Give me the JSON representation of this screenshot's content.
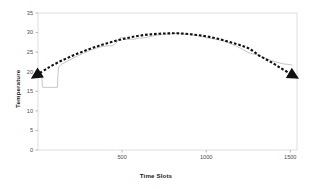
{
  "chart_data": {
    "type": "line",
    "title": "",
    "xlabel": "Time Slots",
    "ylabel": "Temperature",
    "xlim": [
      0,
      1540
    ],
    "ylim": [
      0,
      35
    ],
    "xticks": [
      500,
      1000,
      1500
    ],
    "xtick_labels": [
      "500",
      "1000",
      "1500"
    ],
    "yticks": [
      0,
      5,
      10,
      15,
      20,
      25,
      30,
      35
    ],
    "ytick_labels": [
      "0",
      "5",
      "10",
      "15",
      "20",
      "25",
      "30",
      "35"
    ],
    "grid": false,
    "legend": "none",
    "series": [
      {
        "name": "measured-temperature",
        "style": "solid-thin-gray",
        "color": "#b3b3b3",
        "x": [
          10,
          18,
          22,
          24,
          26,
          30,
          40,
          55,
          70,
          85,
          100,
          115,
          118,
          122,
          140,
          170,
          200,
          235,
          270,
          300,
          330,
          360,
          390,
          415,
          440,
          455,
          470,
          480,
          495,
          510,
          520,
          535,
          550,
          570,
          590,
          610,
          635,
          660,
          690,
          715,
          740,
          765,
          790,
          815,
          840,
          860,
          880,
          900,
          920,
          945,
          965,
          985,
          1005,
          1030,
          1055,
          1080,
          1105,
          1130,
          1155,
          1180,
          1205,
          1230,
          1255,
          1275,
          1295,
          1315,
          1340,
          1360,
          1380,
          1400,
          1420,
          1440,
          1460,
          1480,
          1500,
          1510
        ],
        "y": [
          19.8,
          19.8,
          19.7,
          18.0,
          16.1,
          16.0,
          16.0,
          16.0,
          16.0,
          16.0,
          16.0,
          16.0,
          18.6,
          21.2,
          21.9,
          22.6,
          23.3,
          24.0,
          24.7,
          25.3,
          25.8,
          26.2,
          26.5,
          26.6,
          26.6,
          27.0,
          27.6,
          28.3,
          28.8,
          28.6,
          28.3,
          28.2,
          28.3,
          28.3,
          28.5,
          28.6,
          28.7,
          28.9,
          29.2,
          29.4,
          29.5,
          29.6,
          29.7,
          29.8,
          29.8,
          29.7,
          29.5,
          29.6,
          29.4,
          29.3,
          29.0,
          28.9,
          28.6,
          28.5,
          28.3,
          28.1,
          27.8,
          27.4,
          27.0,
          26.5,
          26.0,
          25.4,
          24.8,
          24.6,
          24.4,
          24.1,
          23.6,
          23.3,
          23.0,
          22.7,
          22.4,
          22.2,
          22.0,
          21.9,
          21.8,
          21.7
        ]
      },
      {
        "name": "fitted-trend",
        "style": "dashed-thick-black",
        "color": "#111111",
        "arrow_start": true,
        "arrow_end": true,
        "x": [
          12,
          60,
          120,
          180,
          240,
          300,
          360,
          420,
          480,
          540,
          600,
          660,
          720,
          780,
          840,
          900,
          960,
          1020,
          1080,
          1140,
          1200,
          1260,
          1320,
          1380,
          1440,
          1500
        ],
        "y": [
          19.7,
          21.0,
          22.4,
          23.6,
          24.7,
          25.7,
          26.6,
          27.4,
          28.1,
          28.7,
          29.2,
          29.5,
          29.7,
          29.8,
          29.8,
          29.6,
          29.3,
          28.9,
          28.3,
          27.6,
          26.8,
          25.8,
          24.0,
          22.6,
          21.0,
          19.5
        ]
      }
    ]
  },
  "plot": {
    "frame_color": "#d0d0d0",
    "background": "#ffffff",
    "tick_color": "#9a9a9a"
  }
}
